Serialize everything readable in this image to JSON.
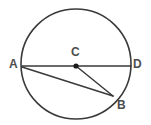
{
  "figure": {
    "background_color": "#ffffff",
    "stroke_color": "#3a3a3a",
    "label_color": "#4d4d4d",
    "circle": {
      "center_x": 76,
      "center_y": 64,
      "radius": 55,
      "stroke_width": 1.6
    },
    "center_dot": {
      "x": 76,
      "y": 66,
      "radius": 2.6,
      "fill": "#1a1a1a"
    },
    "points": [
      {
        "id": "A",
        "label": "A",
        "x": 22,
        "y": 66
      },
      {
        "id": "C",
        "label": "C",
        "x": 76,
        "y": 66
      },
      {
        "id": "D",
        "label": "D",
        "x": 131,
        "y": 66
      },
      {
        "id": "B",
        "label": "B",
        "x": 113,
        "y": 96
      }
    ],
    "segments": [
      {
        "id": "AD",
        "from": "A",
        "to": "D",
        "kind": "diameter",
        "x1": 22,
        "y1": 66,
        "x2": 131,
        "y2": 66
      },
      {
        "id": "AB",
        "from": "A",
        "to": "B",
        "kind": "chord",
        "x1": 22,
        "y1": 67,
        "x2": 113,
        "y2": 96
      },
      {
        "id": "CB",
        "from": "C",
        "to": "B",
        "kind": "radius",
        "x1": 76,
        "y1": 66,
        "x2": 113,
        "y2": 96
      }
    ],
    "labels": {
      "A": "A",
      "B": "B",
      "C": "C",
      "D": "D"
    }
  }
}
